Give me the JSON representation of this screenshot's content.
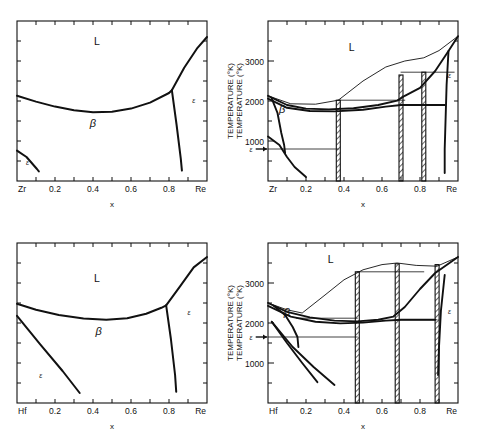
{
  "figure": {
    "name": "zr-re-and-hf-re-phase-diagrams",
    "panel_count": 4,
    "axis_label_x": "x",
    "axis_label_y": "TEMPERATURE (°K)",
    "degree_symbol": "°K"
  },
  "labels": {
    "liquid": "L",
    "beta": "β",
    "epsilon": "ε",
    "zr": "Zr",
    "hf": "Hf",
    "re": "Re",
    "x_ticks": [
      "0.2",
      "0.4",
      "0.6",
      "0.8"
    ],
    "y_ticks_right": [
      "1000",
      "2000",
      "3000"
    ]
  },
  "chart_data": [
    {
      "id": "panel-top-left",
      "type": "line",
      "title": "",
      "subtitle": "Calculated Zr-Re phase diagram (no intermediate phases)",
      "xlabel": "x",
      "ylabel": "TEMPERATURE (°K)",
      "xlim": [
        0,
        1
      ],
      "xtick_values": [
        0.2,
        0.4,
        0.6,
        0.8
      ],
      "xtick_labels": [
        "0.2",
        "0.4",
        "0.6",
        "0.8"
      ],
      "x_end_labels": [
        "Zr",
        "Re"
      ],
      "ylim": [
        0,
        4000
      ],
      "ytick_values": [
        500,
        1000,
        1500,
        2000,
        2500,
        3000,
        3500
      ],
      "ytick_labels": [],
      "grid": false,
      "legend": false,
      "region_labels": [
        {
          "text": "L",
          "x": 0.42,
          "y": 3400
        },
        {
          "text": "β",
          "x": 0.4,
          "y": 1350
        },
        {
          "text": "ε",
          "x": 0.055,
          "y": 400
        },
        {
          "text": "ε",
          "x": 0.93,
          "y": 1950
        }
      ],
      "series": [
        {
          "name": "liquidus-solidus",
          "points": [
            [
              0.0,
              2130
            ],
            [
              0.1,
              1985
            ],
            [
              0.2,
              1860
            ],
            [
              0.3,
              1770
            ],
            [
              0.4,
              1720
            ],
            [
              0.5,
              1730
            ],
            [
              0.6,
              1810
            ],
            [
              0.7,
              1960
            ],
            [
              0.8,
              2200
            ],
            [
              0.815,
              2270
            ]
          ]
        },
        {
          "name": "re-rich-liquidus",
          "points": [
            [
              0.815,
              2270
            ],
            [
              0.88,
              2830
            ],
            [
              0.95,
              3330
            ],
            [
              1.0,
              3600
            ]
          ]
        },
        {
          "name": "epsilon-boundary",
          "points": [
            [
              0.815,
              2270
            ],
            [
              0.84,
              1400
            ],
            [
              0.862,
              560
            ],
            [
              0.868,
              260
            ]
          ]
        },
        {
          "name": "beta-epsilon-zr-rich",
          "points": [
            [
              0.0,
              760
            ],
            [
              0.05,
              600
            ],
            [
              0.105,
              300
            ],
            [
              0.115,
              240
            ]
          ]
        }
      ]
    },
    {
      "id": "panel-top-right",
      "type": "line",
      "title": "",
      "subtitle": "Assessed Zr-Re phase diagram with intermediate line compounds",
      "xlabel": "x",
      "ylabel": "TEMPERATURE (°K)",
      "xlim": [
        0,
        1
      ],
      "xtick_values": [
        0.2,
        0.4,
        0.6,
        0.8
      ],
      "xtick_labels": [
        "0.2",
        "0.4",
        "0.6",
        "0.8"
      ],
      "x_end_labels": [
        "Zr",
        "Re"
      ],
      "ylim": [
        0,
        4000
      ],
      "ytick_values": [
        1000,
        2000,
        3000
      ],
      "ytick_labels": [
        "1000",
        "2000",
        "3000"
      ],
      "grid": false,
      "legend": false,
      "region_labels": [
        {
          "text": "L",
          "x": 0.44,
          "y": 3250
        },
        {
          "text": "β",
          "x": 0.075,
          "y": 1700
        },
        {
          "text": "ε",
          "x": 0.955,
          "y": 2580
        }
      ],
      "arrow_labels": [
        {
          "text": "ε",
          "x": -0.07,
          "y": 800,
          "direction": "right"
        }
      ],
      "line_compounds": [
        {
          "x": 0.37,
          "top": 2020,
          "bottom": 0,
          "hatched": true
        },
        {
          "x": 0.7,
          "top": 2650,
          "bottom": 0,
          "hatched": true
        },
        {
          "x": 0.82,
          "top": 2720,
          "bottom": 0,
          "hatched": true
        }
      ],
      "series": [
        {
          "name": "liquidus",
          "points": [
            [
              0.0,
              2130
            ],
            [
              0.12,
              1930
            ],
            [
              0.25,
              1920
            ],
            [
              0.37,
              2020
            ],
            [
              0.5,
              2500
            ],
            [
              0.62,
              2850
            ],
            [
              0.72,
              3000
            ],
            [
              0.82,
              3080
            ],
            [
              0.9,
              3260
            ],
            [
              1.0,
              3620
            ]
          ]
        },
        {
          "name": "solidus-upper",
          "points": [
            [
              0.0,
              2130
            ],
            [
              0.1,
              1900
            ],
            [
              0.2,
              1810
            ],
            [
              0.32,
              1790
            ],
            [
              0.45,
              1820
            ],
            [
              0.58,
              1900
            ],
            [
              0.68,
              2010
            ],
            [
              0.72,
              2130
            ],
            [
              0.8,
              2330
            ],
            [
              0.88,
              2750
            ],
            [
              0.95,
              3250
            ],
            [
              1.0,
              3620
            ]
          ]
        },
        {
          "name": "solidus-lower",
          "points": [
            [
              0.0,
              2060
            ],
            [
              0.1,
              1830
            ],
            [
              0.22,
              1750
            ],
            [
              0.35,
              1740
            ],
            [
              0.5,
              1780
            ],
            [
              0.62,
              1860
            ],
            [
              0.7,
              1900
            ],
            [
              0.8,
              1900
            ],
            [
              0.88,
              1900
            ],
            [
              0.93,
              1900
            ]
          ]
        },
        {
          "name": "beta-boundary",
          "points": [
            [
              0.02,
              2060
            ],
            [
              0.05,
              1700
            ],
            [
              0.07,
              1200
            ],
            [
              0.085,
              900
            ],
            [
              0.09,
              700
            ]
          ]
        },
        {
          "name": "zr-epsilon",
          "points": [
            [
              0.0,
              1110
            ],
            [
              0.06,
              900
            ],
            [
              0.1,
              600
            ],
            [
              0.14,
              350
            ],
            [
              0.2,
              100
            ]
          ]
        },
        {
          "name": "re-solvus",
          "points": [
            [
              0.95,
              3250
            ],
            [
              0.94,
              2400
            ],
            [
              0.935,
              1600
            ],
            [
              0.93,
              800
            ],
            [
              0.93,
              200
            ]
          ]
        },
        {
          "name": "invariant-2720",
          "points": [
            [
              0.7,
              2720
            ],
            [
              0.98,
              2720
            ]
          ]
        },
        {
          "name": "invariant-2020",
          "points": [
            [
              0.37,
              2020
            ],
            [
              0.72,
              2020
            ]
          ]
        },
        {
          "name": "invariant-1900",
          "points": [
            [
              0.7,
              1900
            ],
            [
              0.93,
              1900
            ]
          ]
        },
        {
          "name": "invariant-800",
          "points": [
            [
              0.0,
              800
            ],
            [
              0.37,
              800
            ]
          ]
        }
      ]
    },
    {
      "id": "panel-bottom-left",
      "type": "line",
      "title": "",
      "subtitle": "Calculated Hf-Re phase diagram (no intermediate phases)",
      "xlabel": "x",
      "ylabel": "TEMPERATURE (°K)",
      "xlim": [
        0,
        1
      ],
      "xtick_values": [
        0.2,
        0.4,
        0.6,
        0.8
      ],
      "xtick_labels": [
        "0.2",
        "0.4",
        "0.6",
        "0.8"
      ],
      "x_end_labels": [
        "Hf",
        "Re"
      ],
      "ylim": [
        0,
        4000
      ],
      "ytick_values": [
        500,
        1000,
        1500,
        2000,
        2500,
        3000,
        3500
      ],
      "ytick_labels": [],
      "grid": false,
      "legend": false,
      "region_labels": [
        {
          "text": "L",
          "x": 0.42,
          "y": 3020
        },
        {
          "text": "β",
          "x": 0.43,
          "y": 1700
        },
        {
          "text": "ε",
          "x": 0.125,
          "y": 620
        },
        {
          "text": "ε",
          "x": 0.905,
          "y": 2200
        }
      ],
      "series": [
        {
          "name": "liquidus-solidus",
          "points": [
            [
              0.0,
              2480
            ],
            [
              0.1,
              2330
            ],
            [
              0.22,
              2200
            ],
            [
              0.35,
              2110
            ],
            [
              0.47,
              2080
            ],
            [
              0.58,
              2120
            ],
            [
              0.68,
              2230
            ],
            [
              0.76,
              2380
            ],
            [
              0.785,
              2440
            ]
          ]
        },
        {
          "name": "re-rich-liquidus",
          "points": [
            [
              0.785,
              2440
            ],
            [
              0.86,
              2930
            ],
            [
              0.93,
              3390
            ],
            [
              1.0,
              3650
            ]
          ]
        },
        {
          "name": "epsilon-boundary",
          "points": [
            [
              0.785,
              2440
            ],
            [
              0.81,
              1600
            ],
            [
              0.832,
              700
            ],
            [
              0.838,
              280
            ]
          ]
        },
        {
          "name": "beta-epsilon-hf-rich",
          "points": [
            [
              0.0,
              2180
            ],
            [
              0.12,
              1480
            ],
            [
              0.24,
              800
            ],
            [
              0.33,
              250
            ]
          ]
        }
      ]
    },
    {
      "id": "panel-bottom-right",
      "type": "line",
      "title": "",
      "subtitle": "Assessed Hf-Re phase diagram with intermediate line compounds",
      "xlabel": "x",
      "ylabel": "TEMPERATURE (°K)",
      "xlim": [
        0,
        1
      ],
      "xtick_values": [
        0.2,
        0.4,
        0.6,
        0.8
      ],
      "xtick_labels": [
        "0.2",
        "0.4",
        "0.6",
        "0.8"
      ],
      "x_end_labels": [
        "Hf",
        "Re"
      ],
      "ylim": [
        0,
        4000
      ],
      "ytick_values": [
        1000,
        2000,
        3000
      ],
      "ytick_labels": [
        "1000",
        "2000",
        "3000"
      ],
      "grid": false,
      "legend": false,
      "region_labels": [
        {
          "text": "L",
          "x": 0.33,
          "y": 3500
        },
        {
          "text": "β",
          "x": 0.1,
          "y": 2180
        },
        {
          "text": "ε",
          "x": 0.955,
          "y": 2220
        }
      ],
      "arrow_labels": [
        {
          "text": "ε",
          "x": -0.07,
          "y": 1650,
          "direction": "right"
        }
      ],
      "line_compounds": [
        {
          "x": 0.47,
          "top": 3280,
          "bottom": 0,
          "hatched": true
        },
        {
          "x": 0.68,
          "top": 3480,
          "bottom": 0,
          "hatched": true
        },
        {
          "x": 0.89,
          "top": 3460,
          "bottom": 0,
          "hatched": true
        }
      ],
      "series": [
        {
          "name": "liquidus",
          "points": [
            [
              0.0,
              2500
            ],
            [
              0.1,
              2330
            ],
            [
              0.18,
              2250
            ],
            [
              0.3,
              2700
            ],
            [
              0.4,
              3080
            ],
            [
              0.5,
              3330
            ],
            [
              0.6,
              3460
            ],
            [
              0.68,
              3500
            ],
            [
              0.78,
              3440
            ],
            [
              0.89,
              3420
            ],
            [
              1.0,
              3650
            ]
          ]
        },
        {
          "name": "solidus-upper",
          "points": [
            [
              0.0,
              2500
            ],
            [
              0.1,
              2280
            ],
            [
              0.22,
              2140
            ],
            [
              0.35,
              2060
            ],
            [
              0.47,
              2040
            ],
            [
              0.58,
              2080
            ],
            [
              0.66,
              2160
            ],
            [
              0.72,
              2400
            ],
            [
              0.8,
              2850
            ],
            [
              0.88,
              3250
            ],
            [
              1.0,
              3650
            ]
          ]
        },
        {
          "name": "solidus-lower",
          "points": [
            [
              0.0,
              2430
            ],
            [
              0.12,
              2160
            ],
            [
              0.25,
              2030
            ],
            [
              0.38,
              1990
            ],
            [
              0.5,
              2010
            ],
            [
              0.62,
              2060
            ],
            [
              0.7,
              2080
            ],
            [
              0.8,
              2080
            ],
            [
              0.88,
              2080
            ]
          ]
        },
        {
          "name": "beta-boundary",
          "points": [
            [
              0.03,
              2430
            ],
            [
              0.09,
              2200
            ],
            [
              0.13,
              1900
            ],
            [
              0.155,
              1650
            ],
            [
              0.16,
              1400
            ]
          ]
        },
        {
          "name": "hf-epsilon-1",
          "points": [
            [
              0.02,
              2030
            ],
            [
              0.1,
              1500
            ],
            [
              0.18,
              1000
            ],
            [
              0.26,
              520
            ]
          ]
        },
        {
          "name": "hf-epsilon-2",
          "points": [
            [
              0.02,
              2030
            ],
            [
              0.13,
              1400
            ],
            [
              0.24,
              900
            ],
            [
              0.35,
              450
            ]
          ]
        },
        {
          "name": "re-solvus",
          "points": [
            [
              0.93,
              3200
            ],
            [
              0.91,
              2300
            ],
            [
              0.9,
              1400
            ],
            [
              0.895,
              700
            ]
          ]
        },
        {
          "name": "invariant-3280",
          "points": [
            [
              0.47,
              3280
            ],
            [
              0.82,
              3280
            ]
          ]
        },
        {
          "name": "invariant-2120",
          "points": [
            [
              0.15,
              2120
            ],
            [
              0.47,
              2120
            ]
          ]
        },
        {
          "name": "invariant-1650",
          "points": [
            [
              0.0,
              1650
            ],
            [
              0.47,
              1650
            ]
          ]
        },
        {
          "name": "invariant-2080",
          "points": [
            [
              0.68,
              2080
            ],
            [
              0.89,
              2080
            ]
          ]
        }
      ]
    }
  ]
}
